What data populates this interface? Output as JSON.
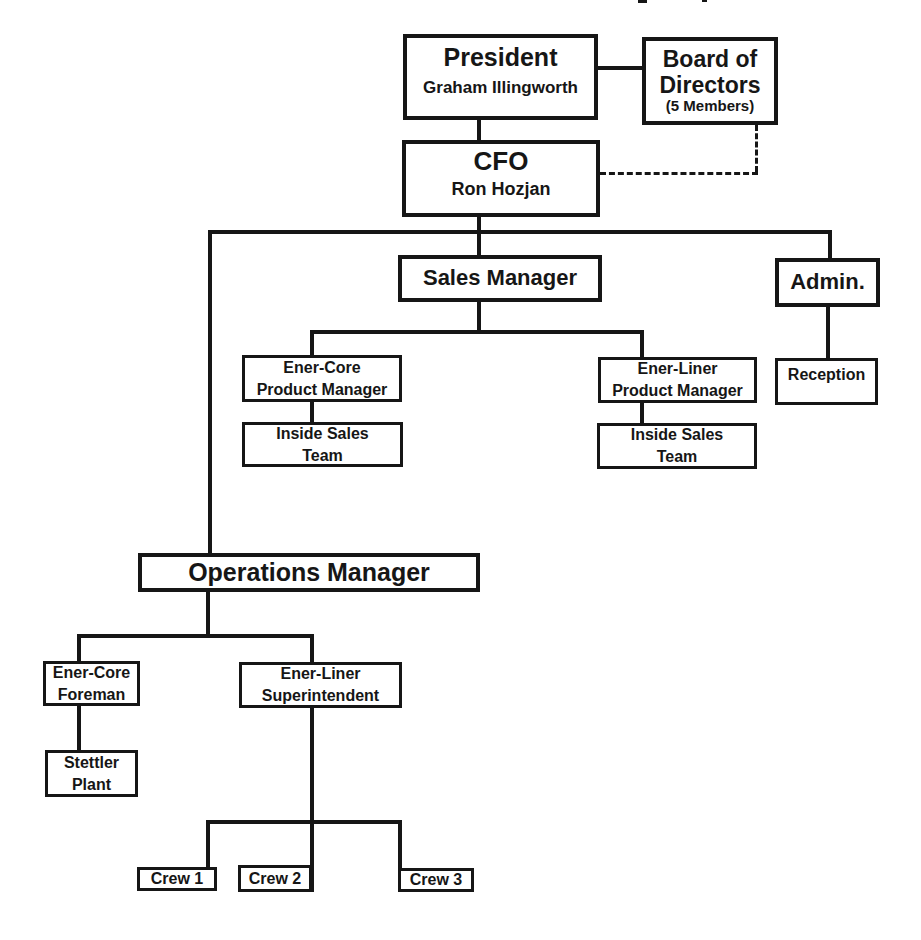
{
  "org_chart": {
    "president": {
      "title": "President",
      "name": "Graham Illingworth"
    },
    "board": {
      "line1": "Board of",
      "line2": "Directors",
      "line3": "(5 Members)"
    },
    "cfo": {
      "title": "CFO",
      "name": "Ron Hozjan"
    },
    "sales_manager": {
      "title": "Sales Manager"
    },
    "admin": {
      "title": "Admin."
    },
    "ener_core_product_manager": {
      "line1": "Ener-Core",
      "line2": "Product Manager"
    },
    "inside_sales_team_core": {
      "line1": "Inside Sales",
      "line2": "Team"
    },
    "ener_liner_product_manager": {
      "line1": "Ener-Liner",
      "line2": "Product Manager"
    },
    "inside_sales_team_liner": {
      "line1": "Inside Sales",
      "line2": "Team"
    },
    "reception": {
      "title": "Reception"
    },
    "operations_manager": {
      "title": "Operations Manager"
    },
    "ener_core_foreman": {
      "line1": "Ener-Core",
      "line2": "Foreman"
    },
    "ener_liner_superintendent": {
      "line1": "Ener-Liner",
      "line2": "Superintendent"
    },
    "stettler_plant": {
      "line1": "Stettler",
      "line2": "Plant"
    },
    "crew_1": {
      "title": "Crew 1"
    },
    "crew_2": {
      "title": "Crew 2"
    },
    "crew_3": {
      "title": "Crew 3"
    },
    "edges": [
      {
        "from": "President",
        "to": "Board of Directors",
        "style": "solid"
      },
      {
        "from": "President",
        "to": "CFO",
        "style": "solid"
      },
      {
        "from": "CFO",
        "to": "Board of Directors",
        "style": "dashed"
      },
      {
        "from": "CFO",
        "to": "Sales Manager",
        "style": "solid"
      },
      {
        "from": "CFO",
        "to": "Admin.",
        "style": "solid"
      },
      {
        "from": "CFO",
        "to": "Operations Manager",
        "style": "solid"
      },
      {
        "from": "Sales Manager",
        "to": "Ener-Core Product Manager",
        "style": "solid"
      },
      {
        "from": "Sales Manager",
        "to": "Ener-Liner Product Manager",
        "style": "solid"
      },
      {
        "from": "Ener-Core Product Manager",
        "to": "Inside Sales Team",
        "style": "solid"
      },
      {
        "from": "Ener-Liner Product Manager",
        "to": "Inside Sales Team",
        "style": "solid"
      },
      {
        "from": "Admin.",
        "to": "Reception",
        "style": "solid"
      },
      {
        "from": "Operations Manager",
        "to": "Ener-Core Foreman",
        "style": "solid"
      },
      {
        "from": "Operations Manager",
        "to": "Ener-Liner Superintendent",
        "style": "solid"
      },
      {
        "from": "Ener-Core Foreman",
        "to": "Stettler Plant",
        "style": "solid"
      },
      {
        "from": "Ener-Liner Superintendent",
        "to": "Crew 1",
        "style": "solid"
      },
      {
        "from": "Ener-Liner Superintendent",
        "to": "Crew 2",
        "style": "solid"
      },
      {
        "from": "Ener-Liner Superintendent",
        "to": "Crew 3",
        "style": "solid"
      }
    ],
    "colors": {
      "ink": "#161616",
      "background": "#ffffff"
    }
  }
}
